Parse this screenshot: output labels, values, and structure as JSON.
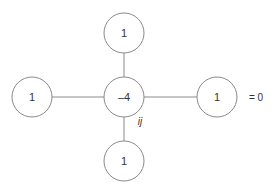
{
  "diagram": {
    "nodes": {
      "top": {
        "label": "1"
      },
      "left": {
        "label": "1"
      },
      "center": {
        "label": "–4",
        "subscript": "ij"
      },
      "right": {
        "label": "1"
      },
      "bottom": {
        "label": "1"
      }
    },
    "equation": "= 0",
    "colors": {
      "stroke": "#8a8a8a",
      "text": "#333333",
      "background": "#ffffff"
    }
  }
}
